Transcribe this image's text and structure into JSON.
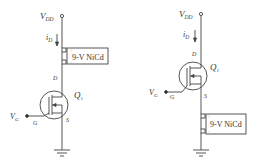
{
  "circuits": [
    {
      "id": "left",
      "supply_label": "V",
      "supply_sub": "DD",
      "current_label": "i",
      "current_sub": "D",
      "battery_label": "9-V NiCd",
      "drain_label": "D",
      "gate_label": "G",
      "source_label": "S",
      "transistor_label": "Q",
      "transistor_sub": "1",
      "gate_voltage_label": "V",
      "gate_voltage_sub": "G",
      "battery_position": "drain"
    },
    {
      "id": "right",
      "supply_label": "V",
      "supply_sub": "DD",
      "current_label": "i",
      "current_sub": "D",
      "battery_label": "9-V NiCd",
      "drain_label": "D",
      "gate_label": "G",
      "source_label": "S",
      "transistor_label": "Q",
      "transistor_sub": "1",
      "gate_voltage_label": "V",
      "gate_voltage_sub": "G",
      "battery_position": "source"
    }
  ],
  "colors": {
    "line": "#444444",
    "text": "#333333",
    "background": "#ffffff"
  }
}
